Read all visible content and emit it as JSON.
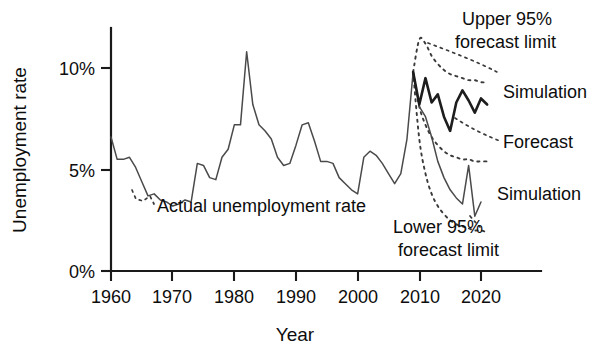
{
  "chart_data": {
    "type": "line",
    "title": "",
    "xlabel": "Year",
    "ylabel": "Unemployment rate",
    "xlim": [
      1960,
      2023
    ],
    "ylim": [
      0,
      12
    ],
    "grid": false,
    "legend_position": "inline-annotations",
    "xticks": [
      1960,
      1970,
      1980,
      1990,
      2000,
      2010,
      2020
    ],
    "xtick_labels": [
      "1960",
      "1970",
      "1980",
      "1990",
      "2000",
      "2010",
      "2020"
    ],
    "yticks": [
      0,
      5,
      10
    ],
    "ytick_labels": [
      "0%",
      "5%",
      "10%"
    ],
    "series": [
      {
        "name": "Actual unemployment rate",
        "style": "solid-thin",
        "x": [
          1960,
          1961,
          1962,
          1963,
          1964,
          1965,
          1966,
          1967,
          1968,
          1969,
          1970,
          1971,
          1972,
          1973,
          1974,
          1975,
          1976,
          1977,
          1978,
          1979,
          1980,
          1981,
          1982,
          1983,
          1984,
          1985,
          1986,
          1987,
          1988,
          1989,
          1990,
          1991,
          1992,
          1993,
          1994,
          1995,
          1996,
          1997,
          1998,
          1999,
          2000,
          2001,
          2002,
          2003,
          2004,
          2005,
          2006,
          2007,
          2008,
          2009
        ],
        "values": [
          6.6,
          5.5,
          5.5,
          5.6,
          5.1,
          4.4,
          3.7,
          3.8,
          3.5,
          3.4,
          3.2,
          3.3,
          3.5,
          3.4,
          5.3,
          5.2,
          4.6,
          4.5,
          5.6,
          6.0,
          7.2,
          7.2,
          10.8,
          8.2,
          7.2,
          6.9,
          6.5,
          5.6,
          5.2,
          5.3,
          6.2,
          7.2,
          7.3,
          6.4,
          5.4,
          5.4,
          5.3,
          4.6,
          4.3,
          4.0,
          3.8,
          5.6,
          5.9,
          5.7,
          5.3,
          4.8,
          4.3,
          4.8,
          6.5,
          9.8
        ]
      },
      {
        "name": "Simulation",
        "style": "solid-thick",
        "note": "upper simulation path",
        "x": [
          2009,
          2010,
          2011,
          2012,
          2013,
          2014,
          2015,
          2016,
          2017,
          2018,
          2019,
          2020,
          2021
        ],
        "values": [
          9.8,
          8.2,
          9.5,
          8.3,
          8.7,
          7.6,
          6.9,
          8.3,
          8.9,
          8.4,
          7.8,
          8.5,
          8.2
        ]
      },
      {
        "name": "Forecast",
        "style": "dotted",
        "x": [
          2009,
          2010,
          2011,
          2012,
          2013,
          2014,
          2015,
          2016,
          2017,
          2018,
          2019,
          2020,
          2021
        ],
        "values": [
          9.8,
          8.1,
          7.2,
          6.6,
          6.2,
          5.9,
          5.7,
          5.6,
          5.5,
          5.5,
          5.4,
          5.4,
          5.4
        ]
      },
      {
        "name": "Upper 95% forecast limit",
        "style": "dotted",
        "x": [
          2009,
          2010,
          2011,
          2012,
          2013,
          2014,
          2015,
          2016,
          2017,
          2018,
          2019,
          2020,
          2021
        ],
        "values": [
          9.8,
          11.4,
          11.2,
          10.6,
          10.2,
          9.9,
          9.7,
          9.6,
          9.5,
          9.4,
          9.4,
          9.3,
          9.3
        ]
      },
      {
        "name": "Lower 95% forecast limit",
        "style": "dotted",
        "x": [
          2009,
          2010,
          2011,
          2012,
          2013,
          2014,
          2015,
          2016,
          2017,
          2018,
          2019,
          2020,
          2021
        ],
        "values": [
          9.8,
          6.5,
          4.8,
          3.8,
          3.2,
          2.8,
          2.5,
          2.3,
          2.2,
          2.1,
          2.0,
          2.0,
          1.9
        ]
      },
      {
        "name": "Simulation",
        "style": "solid-thin",
        "note": "lower simulation path",
        "x": [
          2009,
          2010,
          2011,
          2012,
          2013,
          2014,
          2015,
          2016,
          2017,
          2018,
          2019,
          2020
        ],
        "values": [
          9.8,
          8.1,
          7.6,
          6.6,
          5.4,
          4.6,
          4.0,
          3.6,
          3.3,
          5.2,
          2.7,
          3.4
        ]
      }
    ],
    "annotations": [
      {
        "id": "actual",
        "text": "Actual unemployment rate"
      },
      {
        "id": "upper-limit",
        "text_line1": "Upper 95%",
        "text_line2": "forecast limit"
      },
      {
        "id": "sim-upper",
        "text": "Simulation"
      },
      {
        "id": "forecast",
        "text": "Forecast"
      },
      {
        "id": "sim-lower",
        "text": "Simulation"
      },
      {
        "id": "lower-limit",
        "text_line1": "Lower 95%",
        "text_line2": "forecast limit"
      }
    ]
  },
  "axes": {
    "y_title": "Unemployment rate",
    "x_title": "Year",
    "y_labels": {
      "t10": "10%",
      "t5": "5%",
      "t0": "0%"
    },
    "x_labels": {
      "t1960": "1960",
      "t1970": "1970",
      "t1980": "1980",
      "t1990": "1990",
      "t2000": "2000",
      "t2010": "2010",
      "t2020": "2020"
    }
  },
  "labels": {
    "actual": "Actual unemployment rate",
    "upper_limit_l1": "Upper 95%",
    "upper_limit_l2": "forecast limit",
    "sim_upper": "Simulation",
    "forecast": "Forecast",
    "sim_lower": "Simulation",
    "lower_limit_l1": "Lower 95%",
    "lower_limit_l2": "forecast limit"
  },
  "colors": {
    "background": "#ffffff",
    "axis": "#1a1a1a",
    "actual_line": "#4a4a4a",
    "simulation_thick": "#1d1d1d",
    "dotted": "#3a3a3a",
    "text": "#0d0d0d"
  }
}
